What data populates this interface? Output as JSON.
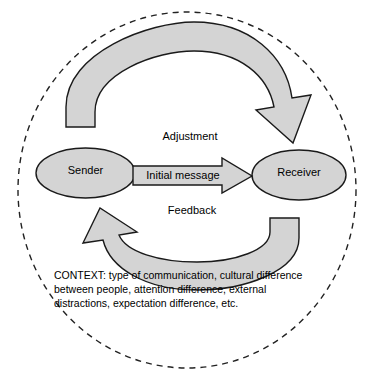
{
  "diagram": {
    "boundary": {
      "name": "context-boundary",
      "style": "dashed-ellipse"
    },
    "nodes": [
      {
        "id": "sender",
        "label": "Sender"
      },
      {
        "id": "receiver",
        "label": "Receiver"
      }
    ],
    "flows": [
      {
        "id": "initial-message",
        "label": "Initial message",
        "from": "sender",
        "to": "receiver",
        "shape": "straight-block-arrow"
      },
      {
        "id": "adjustment",
        "label": "Adjustment",
        "from": "sender",
        "to": "receiver",
        "shape": "curved-block-arrow-top"
      },
      {
        "id": "feedback",
        "label": "Feedback",
        "from": "receiver",
        "to": "sender",
        "shape": "curved-block-arrow-bottom"
      }
    ],
    "context": {
      "label": "CONTEXT:",
      "text": "CONTEXT: type of communication, cultural difference between people, attention difference, external distractions, expectation difference, etc."
    },
    "colors": {
      "shape_fill": "#d4d4d4",
      "shape_stroke": "#1a1a1a",
      "boundary_stroke": "#222222",
      "text": "#000000",
      "background": "#ffffff"
    }
  }
}
